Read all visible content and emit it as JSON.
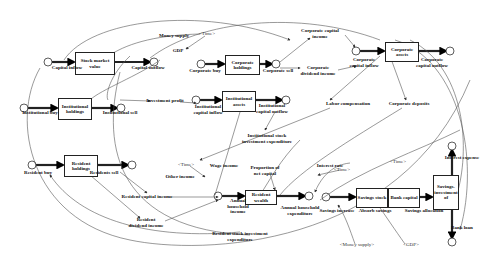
{
  "diagram": {
    "type": "stock-and-flow",
    "stocks": [
      {
        "id": "stock_market",
        "label": "Stock market value",
        "x": 75,
        "y": 52,
        "w": 38,
        "h": 21
      },
      {
        "id": "corp_holdings",
        "label": "Corporate holdings",
        "x": 225,
        "y": 55,
        "w": 33,
        "h": 18
      },
      {
        "id": "corp_assets",
        "label": "Corporate assets",
        "x": 385,
        "y": 42,
        "w": 32,
        "h": 18
      },
      {
        "id": "inst_holdings",
        "label": "Institutional holdings",
        "x": 58,
        "y": 98,
        "w": 32,
        "h": 20
      },
      {
        "id": "inst_assets",
        "label": "Institutional assets",
        "x": 222,
        "y": 91,
        "w": 32,
        "h": 19
      },
      {
        "id": "resident_holdings",
        "label": "Resident holdings",
        "x": 64,
        "y": 155,
        "w": 32,
        "h": 20
      },
      {
        "id": "resident_wealth",
        "label": "Resident wealth",
        "x": 245,
        "y": 190,
        "w": 30,
        "h": 13
      },
      {
        "id": "savings_stock",
        "label": "Savings stock",
        "x": 356,
        "y": 188,
        "w": 30,
        "h": 18
      },
      {
        "id": "bank_capital",
        "label": "Bank capital",
        "x": 388,
        "y": 188,
        "w": 30,
        "h": 18
      },
      {
        "id": "savings_investment",
        "label": "Savings-investment of",
        "x": 433,
        "y": 175,
        "w": 24,
        "h": 33
      }
    ],
    "flows": [
      {
        "label": "Capital inflow",
        "x": 67,
        "y": 66
      },
      {
        "label": "Capital outflow",
        "x": 148,
        "y": 66
      },
      {
        "label": "Corporate buy",
        "x": 205,
        "y": 71
      },
      {
        "label": "Corporate sell",
        "x": 278,
        "y": 71
      },
      {
        "label": "Corporate capital inflow",
        "x": 364,
        "y": 62
      },
      {
        "label": "Corporate capital outflow",
        "x": 432,
        "y": 62
      },
      {
        "label": "Institutional buy",
        "x": 40,
        "y": 113
      },
      {
        "label": "Institutional sell",
        "x": 120,
        "y": 113
      },
      {
        "label": "Institutional capital inflow",
        "x": 208,
        "y": 109
      },
      {
        "label": "Institutional capital outflow",
        "x": 272,
        "y": 108
      },
      {
        "label": "Resident buy",
        "x": 38,
        "y": 173
      },
      {
        "label": "Residents sell",
        "x": 104,
        "y": 173
      },
      {
        "label": "Annual household income",
        "x": 243,
        "y": 208
      },
      {
        "label": "Annual household expenditure",
        "x": 300,
        "y": 210
      },
      {
        "label": "Savings increase",
        "x": 337,
        "y": 210
      },
      {
        "label": "Absorb savings",
        "x": 375,
        "y": 210
      },
      {
        "label": "Savings allocation",
        "x": 424,
        "y": 210
      },
      {
        "label": "Interest expense",
        "x": 458,
        "y": 156
      },
      {
        "label": "Bank loan",
        "x": 452,
        "y": 228
      }
    ],
    "variables": [
      {
        "label": "Money supply",
        "x": 174,
        "y": 36
      },
      {
        "label": "GDP",
        "x": 178,
        "y": 51
      },
      {
        "label": "Corporate capital income",
        "x": 320,
        "y": 33
      },
      {
        "label": "Corporate dividend income",
        "x": 318,
        "y": 70
      },
      {
        "label": "Investment profit",
        "x": 165,
        "y": 101
      },
      {
        "label": "Labor compensation",
        "x": 348,
        "y": 104
      },
      {
        "label": "Corporate deposits",
        "x": 409,
        "y": 104
      },
      {
        "label": "Institutional stock investment expenditure",
        "x": 267,
        "y": 138
      },
      {
        "label": "Wage income",
        "x": 224,
        "y": 166
      },
      {
        "label": "Other income",
        "x": 180,
        "y": 177
      },
      {
        "label": "Proportion of net capital",
        "x": 265,
        "y": 170
      },
      {
        "label": "Interest rate",
        "x": 330,
        "y": 166
      },
      {
        "label": "Resident capital income",
        "x": 147,
        "y": 197
      },
      {
        "label": "Resident dividend income",
        "x": 146,
        "y": 222
      },
      {
        "label": "Resident stock investment expenditure",
        "x": 240,
        "y": 236
      }
    ],
    "shadow_variables": [
      {
        "label": "<Time>",
        "x": 207,
        "y": 33
      },
      {
        "label": "<Time>",
        "x": 186,
        "y": 164
      },
      {
        "label": "<Time>",
        "x": 342,
        "y": 169
      },
      {
        "label": "<Time>",
        "x": 358,
        "y": 161
      },
      {
        "label": "<Money supply>",
        "x": 357,
        "y": 244
      },
      {
        "label": "<GDP>",
        "x": 411,
        "y": 244
      }
    ]
  }
}
